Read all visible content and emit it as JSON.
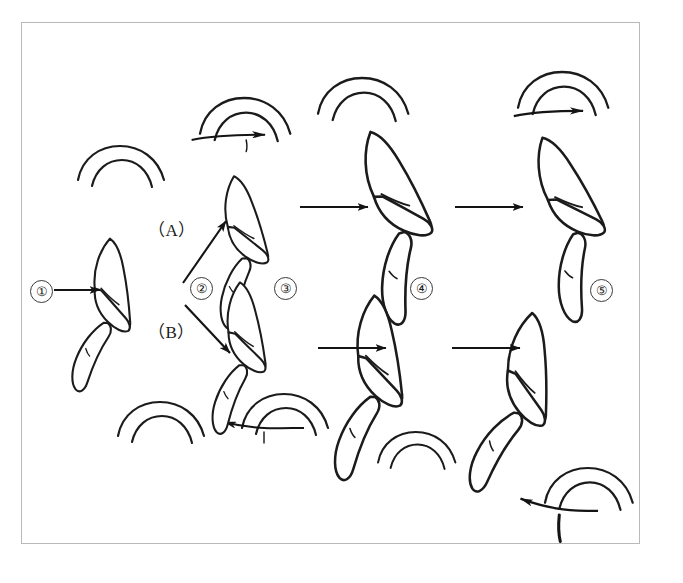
{
  "figure": {
    "title": "Swimming posture sequence diagram",
    "background_color": "#ffffff",
    "ink_color": "#1b1b1b",
    "frame_color": "#b9b9b9"
  },
  "stages": [
    {
      "id": "stage-1",
      "label": "①",
      "number": "1",
      "x": 30,
      "y": 280
    },
    {
      "id": "stage-2",
      "label": "②",
      "number": "2",
      "x": 190,
      "y": 277
    },
    {
      "id": "stage-3",
      "label": "③",
      "number": "3",
      "x": 274,
      "y": 277
    },
    {
      "id": "stage-4",
      "label": "④",
      "number": "4",
      "x": 410,
      "y": 277
    },
    {
      "id": "stage-5",
      "label": "⑤",
      "number": "5",
      "x": 590,
      "y": 279
    }
  ],
  "branches": [
    {
      "id": "branch-a",
      "label": "（A）",
      "x": 148,
      "y": 222,
      "direction": "up-right"
    },
    {
      "id": "branch-b",
      "label": "（B）",
      "x": 148,
      "y": 324,
      "direction": "down-right"
    }
  ],
  "arrows": [
    {
      "id": "arrow-entry",
      "kind": "straight",
      "direction": "right",
      "x1": 54,
      "y1": 290,
      "x2": 104,
      "y2": 290
    },
    {
      "id": "arrow-branch-a",
      "kind": "straight",
      "direction": "up-right",
      "x1": 183,
      "y1": 283,
      "x2": 228,
      "y2": 218
    },
    {
      "id": "arrow-branch-b",
      "kind": "straight",
      "direction": "down-right",
      "x1": 185,
      "y1": 305,
      "x2": 232,
      "y2": 355
    },
    {
      "id": "arrow-top-3-to-4",
      "kind": "straight",
      "direction": "right",
      "x1": 300,
      "y1": 207,
      "x2": 372,
      "y2": 207
    },
    {
      "id": "arrow-top-4-to-5",
      "kind": "straight",
      "direction": "right",
      "x1": 455,
      "y1": 207,
      "x2": 527,
      "y2": 207
    },
    {
      "id": "arrow-bot-3-to-4",
      "kind": "straight",
      "direction": "right",
      "x1": 318,
      "y1": 348,
      "x2": 390,
      "y2": 348
    },
    {
      "id": "arrow-bot-4-to-5",
      "kind": "straight",
      "direction": "right",
      "x1": 452,
      "y1": 348,
      "x2": 524,
      "y2": 348
    }
  ],
  "wave_marks": [
    {
      "id": "wave-upper-left",
      "x": 118,
      "y": 175,
      "arrow": "none",
      "scale": 1.0
    },
    {
      "id": "wave-upper-mid",
      "x": 243,
      "y": 125,
      "arrow": "right",
      "scale": 1.05
    },
    {
      "id": "wave-upper-four",
      "x": 355,
      "y": 105,
      "arrow": "none",
      "scale": 1.05
    },
    {
      "id": "wave-upper-five",
      "x": 560,
      "y": 102,
      "arrow": "right",
      "scale": 1.05
    },
    {
      "id": "wave-lower-left",
      "x": 158,
      "y": 428,
      "arrow": "none",
      "scale": 1.0
    },
    {
      "id": "wave-lower-mid",
      "x": 270,
      "y": 418,
      "arrow": "left",
      "scale": 1.0
    },
    {
      "id": "wave-lower-four",
      "x": 405,
      "y": 455,
      "arrow": "none",
      "scale": 0.9
    },
    {
      "id": "wave-lower-five",
      "x": 570,
      "y": 495,
      "arrow": "left",
      "scale": 1.0
    }
  ],
  "specimens": [
    {
      "id": "specimen-stage-1",
      "stage": "1",
      "row": "single",
      "x": 108,
      "y": 238,
      "rotate": 18,
      "scale": 1.0
    },
    {
      "id": "specimen-stage-3-upper",
      "stage": "3",
      "row": "upper",
      "x": 232,
      "y": 176,
      "rotate": 8,
      "scale": 0.98
    },
    {
      "id": "specimen-stage-3-lower",
      "stage": "3",
      "row": "lower",
      "x": 238,
      "y": 282,
      "rotate": 14,
      "scale": 0.98
    },
    {
      "id": "specimen-stage-4-upper",
      "stage": "4",
      "row": "upper",
      "x": 368,
      "y": 132,
      "rotate": -2,
      "scale": 1.25
    },
    {
      "id": "specimen-stage-4-lower",
      "stage": "4",
      "row": "lower",
      "x": 372,
      "y": 295,
      "rotate": 16,
      "scale": 1.2
    },
    {
      "id": "specimen-stage-5-upper",
      "stage": "5",
      "row": "upper",
      "x": 540,
      "y": 138,
      "rotate": -4,
      "scale": 1.2
    },
    {
      "id": "specimen-stage-5-lower",
      "stage": "5",
      "row": "lower",
      "x": 530,
      "y": 312,
      "rotate": 24,
      "scale": 1.2
    }
  ]
}
